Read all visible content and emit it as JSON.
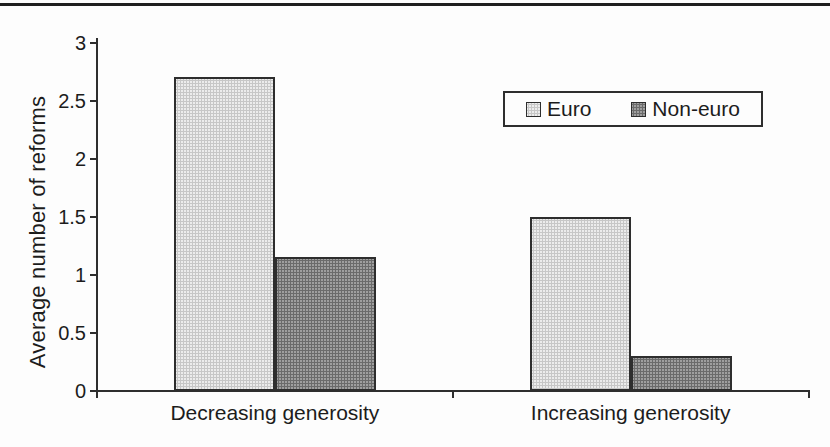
{
  "page": {
    "top_rule_color": "#1f1f1f",
    "background": "#fdfdfd"
  },
  "chart_data": {
    "type": "bar",
    "title": "",
    "xlabel": "",
    "ylabel": "Average number of reforms",
    "ylim": [
      0,
      3
    ],
    "yticks": [
      0,
      0.5,
      1,
      1.5,
      2,
      2.5,
      3
    ],
    "grid": false,
    "legend_position": "inside-top-right",
    "categories": [
      "Decreasing generosity",
      "Increasing generosity"
    ],
    "series": [
      {
        "name": "Euro",
        "color": "#ececec",
        "values": [
          2.7,
          1.5
        ]
      },
      {
        "name": "Non-euro",
        "color": "#9f9f9f",
        "values": [
          1.15,
          0.3
        ]
      }
    ],
    "axis_color": "#2e2e2e",
    "text_color": "#1c1c1c"
  }
}
